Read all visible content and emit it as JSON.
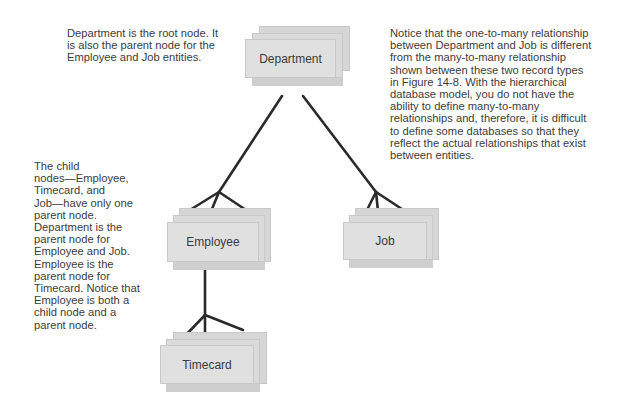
{
  "notes": {
    "root": "Department is the root node. It\nis also the parent node for the\nEmployee and Job entities.",
    "job": "Notice that the one-to-many relationship\nbetween Department and Job is different\nfrom the many-to-many relationship\nshown between these two record types\nin Figure 14-8. With the hierarchical\ndatabase model, you do not have the\nability to define many-to-many\nrelationships and, therefore, it is difficult\nto define some databases so that they\nreflect the actual relationships that exist\nbetween entities.",
    "child": "The child\nnodes—Employee,\nTimecard, and\nJob—have only one\nparent node.\nDepartment is the\nparent node for\nEmployee and Job.\nEmployee is the\nparent node for\nTimecard. Notice that\nEmployee is both a\nchild node and a\nparent node."
  },
  "nodes": {
    "department": "Department",
    "employee": "Employee",
    "job": "Job",
    "timecard": "Timecard"
  },
  "colors": {
    "card_fill": "#e0e0e0",
    "card_border": "#c8c8c8",
    "line": "#2a2a2a",
    "text": "#3a3a3a"
  }
}
